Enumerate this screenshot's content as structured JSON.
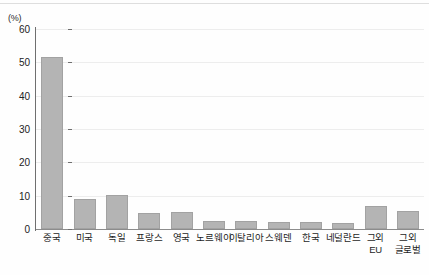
{
  "chart_data": {
    "type": "bar",
    "title": "",
    "subtitle": "",
    "xlabel": "",
    "ylabel": "(%)",
    "unit_label": "(%)",
    "ylim": [
      0,
      60
    ],
    "ytick_step": 10,
    "yticks": [
      0,
      10,
      20,
      30,
      40,
      50,
      60
    ],
    "ytick_labels": [
      "0",
      "10",
      "20",
      "30",
      "40",
      "50",
      "60"
    ],
    "grid": true,
    "grid_axis": "y",
    "legend": false,
    "legend_position": "none",
    "bar_color": "#b4b4b4",
    "bar_edge_color": "#a2a2a2",
    "gridline_color": "#ededed",
    "axis_color": "#6f6f6f",
    "categories": [
      "중국",
      "미국",
      "독일",
      "프랑스",
      "영국",
      "노르웨이",
      "이탈리아",
      "스웨덴",
      "한국",
      "네덜란드",
      "그외\nEU",
      "그외\n글로벌"
    ],
    "values": [
      51.5,
      9.0,
      10.2,
      4.8,
      5.0,
      2.4,
      2.3,
      2.2,
      2.2,
      1.8,
      7.0,
      5.4
    ],
    "series": [
      {
        "name": "",
        "values": [
          51.5,
          9.0,
          10.2,
          4.8,
          5.0,
          2.4,
          2.3,
          2.2,
          2.2,
          1.8,
          7.0,
          5.4
        ]
      }
    ],
    "annotations": []
  }
}
